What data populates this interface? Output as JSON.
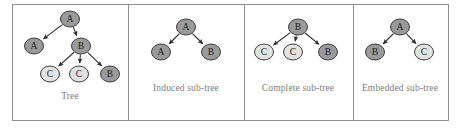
{
  "figure": {
    "background_color": "#ffffff",
    "border_color": "#8f8f8f",
    "divider_color": "#8f8f8f",
    "node_fill_dark": "#9a9a9a",
    "node_fill_light": "#e2e2e2",
    "node_stroke": "#3d3d3d",
    "edge_color": "#2b2b2b",
    "caption_color": "#7d7d7d",
    "label_color": "#1c1c1c",
    "frame": {
      "x": 12,
      "y": 4,
      "width": 436,
      "height": 116
    },
    "dividers": [
      128,
      244,
      353
    ]
  },
  "panels": [
    {
      "id": "tree",
      "caption": "Tree",
      "caption_x": 70,
      "caption_y": 96,
      "nodes": [
        {
          "name": "root-a",
          "label": "A",
          "x": 70,
          "y": 19,
          "rx": 9.5,
          "ry": 8,
          "shade": "dark"
        },
        {
          "name": "left-a",
          "label": "A",
          "x": 34,
          "y": 46,
          "rx": 9.5,
          "ry": 8,
          "shade": "dark"
        },
        {
          "name": "right-b",
          "label": "B",
          "x": 81,
          "y": 46,
          "rx": 9.5,
          "ry": 8,
          "shade": "dark"
        },
        {
          "name": "leaf-c-left",
          "label": "C",
          "x": 50,
          "y": 74,
          "rx": 9.5,
          "ry": 8,
          "shade": "light"
        },
        {
          "name": "leaf-c-middle",
          "label": "C",
          "x": 79,
          "y": 74,
          "rx": 9.5,
          "ry": 8,
          "shade": "light"
        },
        {
          "name": "leaf-b-right",
          "label": "B",
          "x": 110,
          "y": 74,
          "rx": 9.5,
          "ry": 8,
          "shade": "dark"
        }
      ],
      "edges": [
        {
          "name": "edge-root-to-left-a",
          "from": "root-a",
          "to": "left-a"
        },
        {
          "name": "edge-root-to-right-b",
          "from": "root-a",
          "to": "right-b"
        },
        {
          "name": "edge-b-to-c-left",
          "from": "right-b",
          "to": "leaf-c-left"
        },
        {
          "name": "edge-b-to-c-middle",
          "from": "right-b",
          "to": "leaf-c-middle"
        },
        {
          "name": "edge-b-to-b-right",
          "from": "right-b",
          "to": "leaf-b-right"
        }
      ]
    },
    {
      "id": "induced-sub-tree",
      "caption": "Induced sub-tree",
      "caption_x": 186,
      "caption_y": 88,
      "nodes": [
        {
          "name": "root-a",
          "label": "A",
          "x": 186,
          "y": 27,
          "rx": 9.5,
          "ry": 8,
          "shade": "dark"
        },
        {
          "name": "left-a",
          "label": "A",
          "x": 161,
          "y": 52,
          "rx": 9.5,
          "ry": 8,
          "shade": "dark"
        },
        {
          "name": "right-b",
          "label": "B",
          "x": 211,
          "y": 52,
          "rx": 9.5,
          "ry": 8,
          "shade": "dark"
        }
      ],
      "edges": [
        {
          "name": "edge-root-to-left-a",
          "from": "root-a",
          "to": "left-a"
        },
        {
          "name": "edge-root-to-right-b",
          "from": "root-a",
          "to": "right-b"
        }
      ]
    },
    {
      "id": "complete-sub-tree",
      "caption": "Complete sub-tree",
      "caption_x": 298,
      "caption_y": 88,
      "nodes": [
        {
          "name": "root-b",
          "label": "B",
          "x": 298,
          "y": 27,
          "rx": 9.5,
          "ry": 8,
          "shade": "dark"
        },
        {
          "name": "leaf-c-left",
          "label": "C",
          "x": 264,
          "y": 52,
          "rx": 9.5,
          "ry": 8,
          "shade": "light"
        },
        {
          "name": "leaf-c-mid",
          "label": "C",
          "x": 293,
          "y": 52,
          "rx": 9.5,
          "ry": 8,
          "shade": "light"
        },
        {
          "name": "leaf-b-right",
          "label": "B",
          "x": 328,
          "y": 52,
          "rx": 9.5,
          "ry": 8,
          "shade": "dark"
        }
      ],
      "edges": [
        {
          "name": "edge-root-to-c-left",
          "from": "root-b",
          "to": "leaf-c-left"
        },
        {
          "name": "edge-root-to-c-mid",
          "from": "root-b",
          "to": "leaf-c-mid"
        },
        {
          "name": "edge-root-to-b-right",
          "from": "root-b",
          "to": "leaf-b-right"
        }
      ]
    },
    {
      "id": "embedded-sub-tree",
      "caption": "Embedded sub-tree",
      "caption_x": 400,
      "caption_y": 88,
      "nodes": [
        {
          "name": "root-a",
          "label": "A",
          "x": 400,
          "y": 27,
          "rx": 9.5,
          "ry": 8,
          "shade": "dark"
        },
        {
          "name": "left-b",
          "label": "B",
          "x": 375,
          "y": 52,
          "rx": 9.5,
          "ry": 8,
          "shade": "dark"
        },
        {
          "name": "right-c",
          "label": "C",
          "x": 424,
          "y": 52,
          "rx": 9.5,
          "ry": 8,
          "shade": "light"
        }
      ],
      "edges": [
        {
          "name": "edge-root-to-left-b",
          "from": "root-a",
          "to": "left-b"
        },
        {
          "name": "edge-root-to-right-c",
          "from": "root-a",
          "to": "right-c"
        }
      ]
    }
  ]
}
